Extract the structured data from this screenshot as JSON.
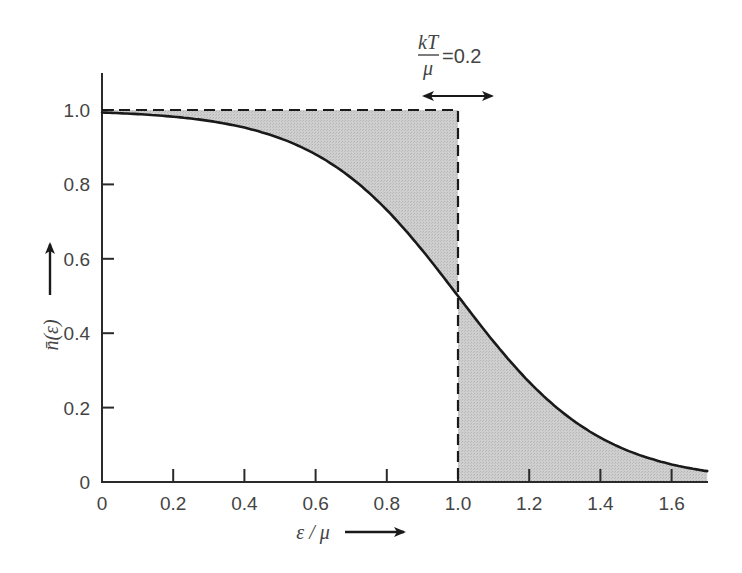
{
  "chart_data": {
    "type": "area",
    "title": "",
    "xlabel": "ε / μ",
    "ylabel": "n̄(ε)",
    "xlim": [
      0,
      1.7
    ],
    "ylim": [
      0,
      1.1
    ],
    "grid": false,
    "legend": null,
    "x_ticks": [
      0,
      0.2,
      0.4,
      0.6,
      0.8,
      1.0,
      1.2,
      1.4,
      1.6
    ],
    "x_tick_labels": [
      "0",
      "0.2",
      "0.4",
      "0.6",
      "0.8",
      "1.0",
      "1.2",
      "1.4",
      "1.6"
    ],
    "y_ticks": [
      0,
      0.2,
      0.4,
      0.6,
      0.8,
      1.0
    ],
    "y_tick_labels": [
      "0",
      "0.2",
      "0.4",
      "0.6",
      "0.8",
      "1.0"
    ],
    "series": [
      {
        "name": "Fermi-Dirac occupancy n̄(ε) at kT/μ = 0.2",
        "style": "solid",
        "x": [
          0,
          0.1,
          0.2,
          0.3,
          0.4,
          0.5,
          0.6,
          0.7,
          0.8,
          0.9,
          1.0,
          1.1,
          1.2,
          1.3,
          1.4,
          1.5,
          1.6,
          1.7
        ],
        "values": [
          0.993,
          0.989,
          0.982,
          0.971,
          0.953,
          0.924,
          0.881,
          0.818,
          0.731,
          0.622,
          0.5,
          0.378,
          0.269,
          0.182,
          0.119,
          0.076,
          0.047,
          0.029
        ]
      },
      {
        "name": "Step function (T = 0)",
        "style": "dashed",
        "x": [
          0,
          1.0,
          1.0
        ],
        "values": [
          1.0,
          1.0,
          0.0
        ]
      }
    ],
    "shaded_regions": [
      {
        "description": "Area between step function and curve for ε/μ < 1",
        "x_range": [
          0,
          1.0
        ],
        "color": "#c8c8c8"
      },
      {
        "description": "Area under curve for ε/μ > 1",
        "x_range": [
          1.0,
          1.7
        ],
        "color": "#c8c8c8"
      }
    ],
    "annotations": [
      {
        "text": "kT/μ = 0.2",
        "position": "top, centered near ε/μ = 1.0",
        "with_double_arrow": true
      }
    ]
  },
  "labels": {
    "x_axis": "ε / μ",
    "y_axis": "n̄(ε)",
    "annotation_numerator": "kT",
    "annotation_denominator": "μ",
    "annotation_value": "=0.2"
  },
  "colors": {
    "curve": "#1a1a1a",
    "shade": "#c8c8c8",
    "axis": "#2a2a2a",
    "text": "#444444"
  }
}
